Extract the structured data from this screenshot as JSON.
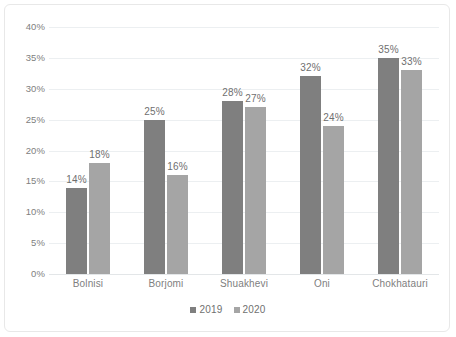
{
  "chart_data": {
    "type": "bar",
    "title": "",
    "subtitle": "",
    "xlabel": "",
    "ylabel": "",
    "categories": [
      "Bolnisi",
      "Borjomi",
      "Shuakhevi",
      "Oni",
      "Chokhatauri"
    ],
    "series": [
      {
        "name": "2019",
        "color": "#7f7f7f",
        "values": [
          14,
          25,
          28,
          32,
          35
        ],
        "labels": [
          "14%",
          "25%",
          "28%",
          "32%",
          "35%"
        ]
      },
      {
        "name": "2020",
        "color": "#a5a5a5",
        "values": [
          18,
          16,
          27,
          24,
          33
        ],
        "labels": [
          "18%",
          "16%",
          "27%",
          "24%",
          "33%"
        ]
      }
    ],
    "ylim": [
      0,
      40
    ],
    "ytick_values": [
      0,
      5,
      10,
      15,
      20,
      25,
      30,
      35,
      40
    ],
    "ytick_labels": [
      "0%",
      "5%",
      "10%",
      "15%",
      "20%",
      "25%",
      "30%",
      "35%",
      "40%"
    ],
    "grid": true,
    "legend_position": "bottom-center",
    "value_labels_shown": true,
    "units": "percent"
  },
  "legend": {
    "items": [
      {
        "label": "2019",
        "marker": "square-marker"
      },
      {
        "label": "2020",
        "marker": "square-marker"
      }
    ]
  }
}
